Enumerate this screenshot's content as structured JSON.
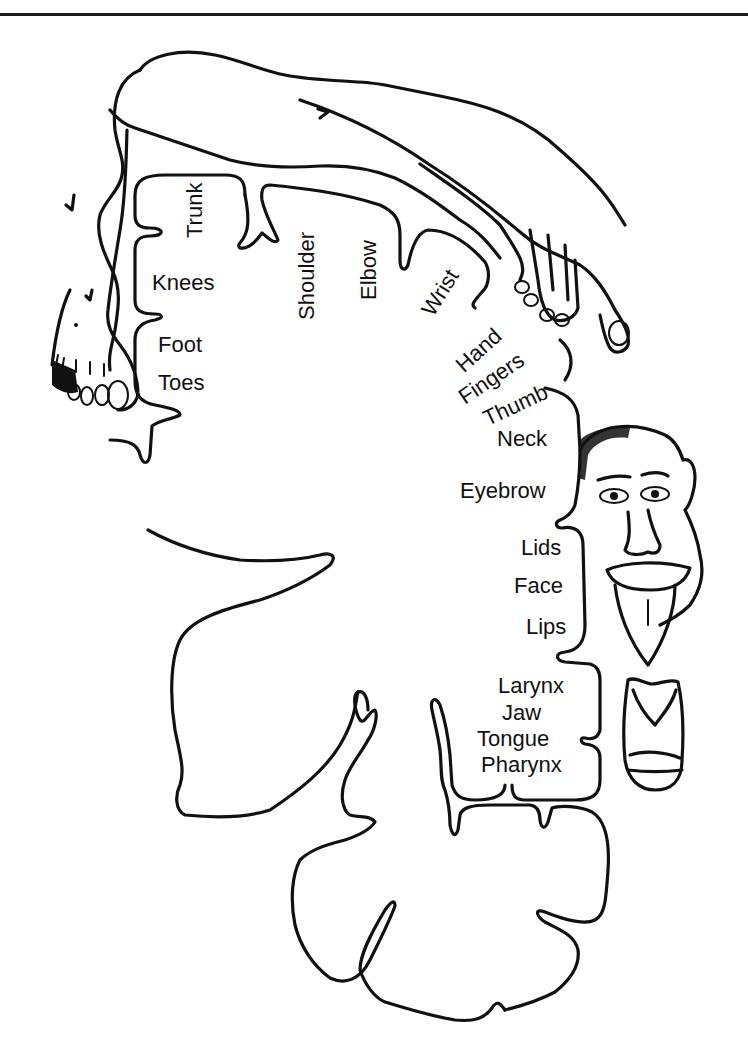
{
  "figure": {
    "line_color": "#111111",
    "background": "#ffffff"
  },
  "labels": {
    "trunk": "Trunk",
    "knees": "Knees",
    "foot": "Foot",
    "toes": "Toes",
    "shoulder": "Shoulder",
    "elbow": "Elbow",
    "wrist": "Wrist",
    "hand": "Hand",
    "fingers": "Fingers",
    "thumb": "Thumb",
    "neck": "Neck",
    "eyebrow": "Eyebrow",
    "lids": "Lids",
    "face": "Face",
    "lips": "Lips",
    "larynx": "Larynx",
    "jaw": "Jaw",
    "tongue": "Tongue",
    "pharynx": "Pharynx"
  },
  "illustrations": [
    "leg-and-foot",
    "arm-and-hand",
    "face-with-tongue",
    "larynx-jaw"
  ]
}
